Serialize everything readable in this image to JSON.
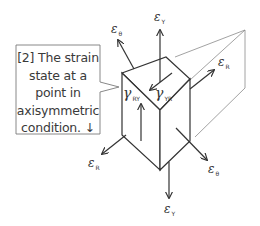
{
  "callout": {
    "lines": [
      "[2] The strain",
      "state at a",
      "point in",
      "axisymmetric",
      "condition. ↓"
    ]
  },
  "labels": {
    "eps_theta_top": {
      "sym": "ε",
      "sub": "θ"
    },
    "eps_y_top": {
      "sym": "ε",
      "sub": "Y"
    },
    "eps_r_right": {
      "sym": "ε",
      "sub": "R"
    },
    "gamma_ry": {
      "sym": "γ",
      "sub": "RY"
    },
    "gamma_yr": {
      "sym": "γ",
      "sub": "YR"
    },
    "eps_r_left": {
      "sym": "ε",
      "sub": "R"
    },
    "eps_theta_bottom": {
      "sym": "ε",
      "sub": "θ"
    },
    "eps_y_bottom": {
      "sym": "ε",
      "sub": "Y"
    }
  },
  "colors": {
    "line": "#3a3a3a",
    "thin_line": "#8a8a8a",
    "box_border": "#7a7a7a"
  }
}
